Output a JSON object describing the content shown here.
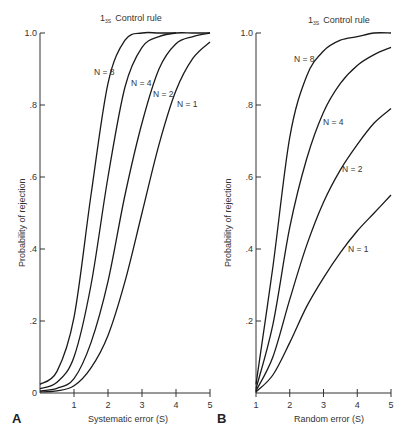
{
  "chart_data": [
    {
      "panel": "A",
      "type": "line",
      "title": "1₃ₛ Control rule",
      "title_main": "1",
      "title_sub": "3S",
      "title_rest": "Control rule",
      "xlabel": "Systematic error (S)",
      "ylabel": "Probability of rejection",
      "xlim": [
        0,
        5
      ],
      "ylim": [
        0,
        1.0
      ],
      "xticks": [
        "1",
        "2",
        "3",
        "4",
        "5"
      ],
      "yticks": [
        "0",
        ".2",
        ".4",
        ".6",
        ".8",
        "1.0"
      ],
      "grid": false,
      "series": [
        {
          "name": "N = 1",
          "x": [
            0,
            0.5,
            1,
            1.5,
            2,
            2.5,
            3,
            3.5,
            4,
            4.5,
            5
          ],
          "values": [
            0.003,
            0.006,
            0.02,
            0.07,
            0.16,
            0.31,
            0.5,
            0.69,
            0.84,
            0.93,
            0.975
          ]
        },
        {
          "name": "N = 2",
          "x": [
            0,
            0.5,
            1,
            1.5,
            2,
            2.5,
            3,
            3.5,
            4,
            4.5,
            5
          ],
          "values": [
            0.006,
            0.013,
            0.04,
            0.14,
            0.31,
            0.55,
            0.75,
            0.9,
            0.97,
            0.99,
            1.0
          ]
        },
        {
          "name": "N = 4",
          "x": [
            0,
            0.5,
            1,
            1.5,
            2,
            2.5,
            3,
            3.5,
            4,
            4.5,
            5
          ],
          "values": [
            0.012,
            0.03,
            0.1,
            0.3,
            0.6,
            0.85,
            0.96,
            0.99,
            1.0,
            1.0,
            1.0
          ]
        },
        {
          "name": "N = 8",
          "x": [
            0,
            0.5,
            1,
            1.5,
            2,
            2.5,
            3,
            3.5,
            4
          ],
          "values": [
            0.024,
            0.06,
            0.21,
            0.55,
            0.86,
            0.98,
            1.0,
            1.0,
            1.0
          ]
        }
      ]
    },
    {
      "panel": "B",
      "type": "line",
      "title": "1₃ₛ Control rule",
      "title_main": "1",
      "title_sub": "3S",
      "title_rest": "Control rule",
      "xlabel": "Random error (S)",
      "ylabel": "Probability of rejection",
      "xlim": [
        1,
        5
      ],
      "ylim": [
        0,
        1.0
      ],
      "xticks": [
        "1",
        "2",
        "3",
        "4",
        "5"
      ],
      "yticks": [
        ".2",
        ".4",
        ".6",
        ".8",
        "1.0"
      ],
      "grid": false,
      "series": [
        {
          "name": "N = 1",
          "x": [
            1,
            1.5,
            2,
            2.5,
            3,
            3.5,
            4,
            4.5,
            5
          ],
          "values": [
            0.003,
            0.05,
            0.14,
            0.24,
            0.32,
            0.39,
            0.45,
            0.5,
            0.55
          ]
        },
        {
          "name": "N = 2",
          "x": [
            1,
            1.5,
            2,
            2.5,
            3,
            3.5,
            4,
            4.5,
            5
          ],
          "values": [
            0.006,
            0.1,
            0.26,
            0.41,
            0.53,
            0.62,
            0.69,
            0.75,
            0.79
          ]
        },
        {
          "name": "N = 4",
          "x": [
            1,
            1.5,
            2,
            2.5,
            3,
            3.5,
            4,
            4.5,
            5
          ],
          "values": [
            0.012,
            0.19,
            0.46,
            0.65,
            0.78,
            0.86,
            0.91,
            0.94,
            0.96
          ]
        },
        {
          "name": "N = 8",
          "x": [
            1,
            1.5,
            2,
            2.5,
            3,
            3.5,
            4,
            4.5,
            5
          ],
          "values": [
            0.024,
            0.35,
            0.71,
            0.88,
            0.95,
            0.98,
            0.99,
            1.0,
            1.0
          ]
        }
      ]
    }
  ],
  "panels": {
    "A": {
      "letter": "A",
      "xlabel": "Systematic error (S)",
      "ylabel": "Probability of rejection",
      "title_main": "1",
      "title_sub": "3S",
      "title_rest": "Control rule",
      "labels": {
        "n8": "N = 8",
        "n4": "N = 4",
        "n2": "N = 2",
        "n1": "N = 1"
      }
    },
    "B": {
      "letter": "B",
      "xlabel": "Random error (S)",
      "ylabel": "Probability of rejection",
      "title_main": "1",
      "title_sub": "3S",
      "title_rest": "Control rule",
      "labels": {
        "n8": "N = 8",
        "n4": "N = 4",
        "n2": "N = 2",
        "n1": "N = 1"
      }
    }
  }
}
